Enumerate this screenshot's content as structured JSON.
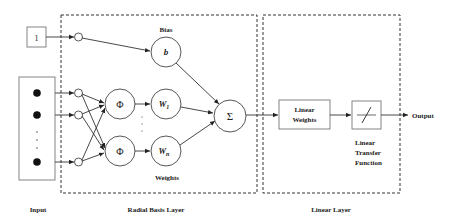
{
  "diagram": {
    "type": "radial-basis-function-network",
    "nodes": {
      "bias_input": "1",
      "bias_label": "Bias",
      "bias_symbol": "b",
      "phi_symbol": "Φ",
      "weight_1": "W",
      "weight_1_sub": "1",
      "weight_n": "W",
      "weight_n_sub": "n",
      "weights_label": "Weights",
      "sum_symbol": "Σ",
      "linear_weights_line1": "Linear",
      "linear_weights_line2": "Weights",
      "transfer_label_line1": "Linear",
      "transfer_label_line2": "Transfer",
      "transfer_label_line3": "Function",
      "output_label": "Output"
    },
    "sections": {
      "input": "Input",
      "radial_basis_layer": "Radial Basis Layer",
      "linear_layer": "Linear Layer"
    },
    "colors": {
      "stroke": "#333333",
      "box_border": "#777777",
      "background": "#ffffff"
    }
  }
}
